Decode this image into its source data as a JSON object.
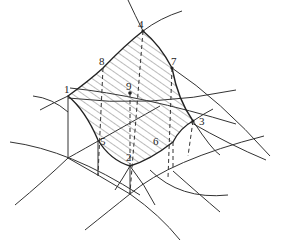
{
  "diagram": {
    "type": "curved-surface-element",
    "nodes": [
      {
        "id": "1",
        "label": "1",
        "x": 68,
        "y": 96
      },
      {
        "id": "2",
        "label": "2",
        "x": 130,
        "y": 166
      },
      {
        "id": "3",
        "label": "3",
        "x": 193,
        "y": 121
      },
      {
        "id": "4",
        "label": "4",
        "x": 143,
        "y": 31
      },
      {
        "id": "5",
        "label": "5",
        "x": 98,
        "y": 140
      },
      {
        "id": "6",
        "label": "6",
        "x": 173,
        "y": 142
      },
      {
        "id": "7",
        "label": "7",
        "x": 172,
        "y": 68
      },
      {
        "id": "8",
        "label": "8",
        "x": 103,
        "y": 68
      },
      {
        "id": "9",
        "label": "9",
        "x": 130,
        "y": 93
      }
    ],
    "colors": {
      "line": "#333333",
      "hatch": "#555555",
      "background": "#ffffff"
    }
  }
}
